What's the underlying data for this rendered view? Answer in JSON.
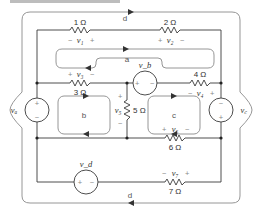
{
  "diagram": {
    "type": "circuit",
    "resistors": [
      {
        "id": "R1",
        "value": "1 Ω",
        "voltage": "v1",
        "polarity": [
          "−",
          "+"
        ]
      },
      {
        "id": "R2",
        "value": "2 Ω",
        "voltage": "v2",
        "polarity": [
          "+",
          "−"
        ]
      },
      {
        "id": "R3",
        "value": "3 Ω",
        "voltage": "v3",
        "polarity": [
          "+",
          "−"
        ]
      },
      {
        "id": "R4",
        "value": "4 Ω",
        "voltage": "v4",
        "polarity": [
          "−",
          "+"
        ]
      },
      {
        "id": "R5",
        "value": "5 Ω",
        "voltage": "v5",
        "polarity": [
          "+",
          "−"
        ]
      },
      {
        "id": "R6",
        "value": "6 Ω",
        "voltage": "v6",
        "polarity": [
          "+",
          "−"
        ]
      },
      {
        "id": "R7",
        "value": "7 Ω",
        "voltage": "v7",
        "polarity": [
          "−",
          "+"
        ]
      }
    ],
    "sources": [
      {
        "id": "va",
        "label": "va",
        "top": "+",
        "bottom": "−"
      },
      {
        "id": "vb",
        "label": "vb",
        "left": "+",
        "right": "−"
      },
      {
        "id": "vc",
        "label": "vc",
        "top": "−",
        "bottom": "+"
      },
      {
        "id": "vd",
        "label": "vd",
        "left": "+",
        "right": "−"
      }
    ],
    "loops": [
      {
        "id": "a",
        "label": "a",
        "direction": "clockwise"
      },
      {
        "id": "b",
        "label": "b",
        "direction": "clockwise"
      },
      {
        "id": "c",
        "label": "c",
        "direction": "counterclockwise"
      },
      {
        "id": "d",
        "label": "d",
        "direction": "clockwise"
      }
    ],
    "labels": {
      "r1": "1 Ω",
      "r2": "2 Ω",
      "r3": "3 Ω",
      "r4": "4 Ω",
      "r5": "5 Ω",
      "r6": "6 Ω",
      "r7": "7 Ω",
      "v1": "v₁",
      "v2": "v₂",
      "v3": "v₃",
      "v4": "v₄",
      "v5": "v₅",
      "v6": "v₆",
      "v7": "v₇",
      "va": "vₐ",
      "vb": "v_b",
      "vc": "v꜀",
      "vd": "v_d",
      "plus": "+",
      "minus": "−",
      "loop_a": "a",
      "loop_b": "b",
      "loop_c": "c",
      "loop_d_top": "d",
      "loop_d_bottom": "d"
    }
  }
}
